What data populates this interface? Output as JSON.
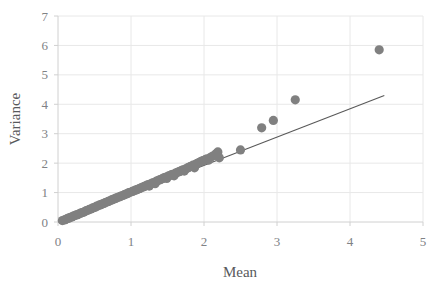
{
  "chart_data": {
    "type": "scatter",
    "title": "",
    "xlabel": "Mean",
    "ylabel": "Variance",
    "xlim": [
      0,
      5
    ],
    "ylim": [
      0,
      7
    ],
    "xticks": [
      0,
      1,
      2,
      3,
      4,
      5
    ],
    "yticks": [
      0,
      1,
      2,
      3,
      4,
      5,
      6,
      7
    ],
    "xtick_labels": [
      "0",
      "1",
      "2",
      "3",
      "4",
      "5"
    ],
    "ytick_labels": [
      "0",
      "1",
      "2",
      "3",
      "4",
      "5",
      "6",
      "7"
    ],
    "grid": {
      "horizontal": true,
      "vertical": true
    },
    "legend": null,
    "marker_color": "#808080",
    "marker_size": 4.6,
    "line_color": "#595959",
    "gridline_color": "#e8e8e8",
    "axis_color": "#d9d9d9",
    "series": [
      {
        "name": "observations",
        "type": "scatter",
        "points": [
          [
            0.06,
            0.05
          ],
          [
            0.09,
            0.07
          ],
          [
            0.11,
            0.09
          ],
          [
            0.13,
            0.12
          ],
          [
            0.15,
            0.13
          ],
          [
            0.17,
            0.16
          ],
          [
            0.19,
            0.17
          ],
          [
            0.21,
            0.2
          ],
          [
            0.23,
            0.22
          ],
          [
            0.25,
            0.24
          ],
          [
            0.27,
            0.25
          ],
          [
            0.29,
            0.28
          ],
          [
            0.31,
            0.3
          ],
          [
            0.33,
            0.32
          ],
          [
            0.35,
            0.33
          ],
          [
            0.37,
            0.36
          ],
          [
            0.39,
            0.39
          ],
          [
            0.41,
            0.4
          ],
          [
            0.43,
            0.43
          ],
          [
            0.45,
            0.44
          ],
          [
            0.47,
            0.47
          ],
          [
            0.49,
            0.49
          ],
          [
            0.51,
            0.5
          ],
          [
            0.53,
            0.54
          ],
          [
            0.55,
            0.55
          ],
          [
            0.57,
            0.58
          ],
          [
            0.59,
            0.59
          ],
          [
            0.61,
            0.62
          ],
          [
            0.63,
            0.63
          ],
          [
            0.65,
            0.66
          ],
          [
            0.67,
            0.68
          ],
          [
            0.69,
            0.7
          ],
          [
            0.71,
            0.72
          ],
          [
            0.73,
            0.74
          ],
          [
            0.75,
            0.77
          ],
          [
            0.77,
            0.78
          ],
          [
            0.79,
            0.81
          ],
          [
            0.81,
            0.82
          ],
          [
            0.83,
            0.85
          ],
          [
            0.85,
            0.86
          ],
          [
            0.87,
            0.89
          ],
          [
            0.89,
            0.9
          ],
          [
            0.91,
            0.93
          ],
          [
            0.93,
            0.95
          ],
          [
            0.95,
            0.96
          ],
          [
            0.97,
            1.0
          ],
          [
            0.99,
            1.01
          ],
          [
            1.02,
            1.04
          ],
          [
            1.04,
            1.06
          ],
          [
            1.06,
            1.08
          ],
          [
            1.08,
            1.1
          ],
          [
            1.1,
            1.12
          ],
          [
            1.12,
            1.14
          ],
          [
            1.14,
            1.16
          ],
          [
            1.16,
            1.19
          ],
          [
            1.18,
            1.2
          ],
          [
            1.2,
            1.23
          ],
          [
            1.22,
            1.25
          ],
          [
            1.24,
            1.27
          ],
          [
            1.25,
            1.22
          ],
          [
            1.27,
            1.3
          ],
          [
            1.29,
            1.32
          ],
          [
            1.31,
            1.34
          ],
          [
            1.33,
            1.3
          ],
          [
            1.35,
            1.39
          ],
          [
            1.37,
            1.41
          ],
          [
            1.39,
            1.43
          ],
          [
            1.41,
            1.45
          ],
          [
            1.43,
            1.47
          ],
          [
            1.45,
            1.5
          ],
          [
            1.47,
            1.52
          ],
          [
            1.49,
            1.48
          ],
          [
            1.51,
            1.56
          ],
          [
            1.53,
            1.58
          ],
          [
            1.55,
            1.6
          ],
          [
            1.57,
            1.62
          ],
          [
            1.59,
            1.57
          ],
          [
            1.61,
            1.66
          ],
          [
            1.63,
            1.68
          ],
          [
            1.65,
            1.7
          ],
          [
            1.67,
            1.72
          ],
          [
            1.69,
            1.75
          ],
          [
            1.71,
            1.77
          ],
          [
            1.73,
            1.73
          ],
          [
            1.75,
            1.81
          ],
          [
            1.77,
            1.83
          ],
          [
            1.79,
            1.86
          ],
          [
            1.81,
            1.88
          ],
          [
            1.83,
            1.9
          ],
          [
            1.85,
            1.93
          ],
          [
            1.87,
            1.84
          ],
          [
            1.89,
            1.97
          ],
          [
            1.91,
            1.99
          ],
          [
            1.93,
            2.02
          ],
          [
            1.95,
            2.04
          ],
          [
            1.97,
            2.07
          ],
          [
            1.99,
            2.09
          ],
          [
            2.02,
            2.12
          ],
          [
            2.04,
            2.15
          ],
          [
            2.06,
            2.1
          ],
          [
            2.09,
            2.2
          ],
          [
            2.12,
            2.24
          ],
          [
            2.15,
            2.28
          ],
          [
            2.17,
            2.33
          ],
          [
            2.19,
            2.38
          ],
          [
            2.21,
            2.18
          ]
        ]
      },
      {
        "name": "outliers",
        "type": "scatter",
        "points": [
          [
            2.5,
            2.45
          ],
          [
            2.79,
            3.2
          ],
          [
            2.95,
            3.45
          ],
          [
            3.25,
            4.15
          ],
          [
            4.4,
            5.85
          ]
        ]
      },
      {
        "name": "reference-line",
        "type": "line",
        "points": [
          [
            0.0,
            0.0
          ],
          [
            4.47,
            4.3
          ]
        ]
      }
    ]
  },
  "layout": {
    "plot_left_px": 58,
    "plot_right_px": 423,
    "plot_top_px": 16,
    "plot_bottom_px": 222
  }
}
